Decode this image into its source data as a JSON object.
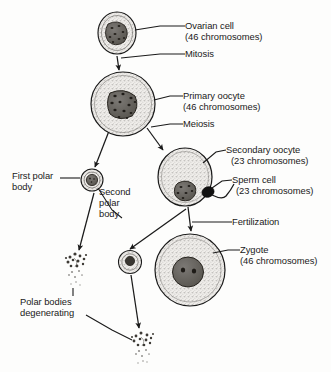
{
  "diagram": {
    "background_color": "#fdfdfc",
    "ink_color": "#1a1a1a",
    "cell_fill": "#e8e6e2",
    "nucleus_fill": "#6d6a66"
  },
  "labels": {
    "ovarian_cell": "Ovarian cell",
    "ovarian_cell_chromosomes": "(46 chromosomes)",
    "mitosis": "Mitosis",
    "primary_oocyte": "Primary oocyte",
    "primary_oocyte_chromosomes": "(46 chromosomes)",
    "meiosis": "Meiosis",
    "secondary_oocyte": "Secondary oocyte",
    "secondary_oocyte_chromosomes": "(23 chromosomes)",
    "sperm_cell": "Sperm cell",
    "sperm_cell_chromosomes": "(23 chromosomes)",
    "fertilization": "Fertilization",
    "zygote": "Zygote",
    "zygote_chromosomes": "(46 chromosomes)",
    "first_polar_body": "First polar\nbody",
    "second_polar_body": "Second\npolar\nbody",
    "polar_bodies_degenerating": "Polar bodies\ndegenerating"
  },
  "cells": [
    {
      "name": "ovarian-cell",
      "cx": 117,
      "cy": 33,
      "rx": 19,
      "ry": 21,
      "nucleus_rx": 11,
      "nucleus_ry": 13,
      "chromosome_count": 46
    },
    {
      "name": "primary-oocyte",
      "cx": 123,
      "cy": 104,
      "rx": 32,
      "ry": 32,
      "nucleus_rx": 14,
      "nucleus_ry": 14,
      "chromosome_count": 46
    },
    {
      "name": "secondary-oocyte",
      "cx": 185,
      "cy": 177,
      "rx": 27,
      "ry": 29,
      "nucleus_rx": 11,
      "nucleus_ry": 11,
      "chromosome_count": 23
    },
    {
      "name": "zygote",
      "cx": 190,
      "cy": 270,
      "rx": 35,
      "ry": 36,
      "nucleus_rx": 15,
      "nucleus_ry": 15,
      "chromosome_count": 46
    },
    {
      "name": "first-polar-body",
      "cx": 92,
      "cy": 180,
      "rx": 11,
      "ry": 11,
      "nucleus_rx": 6,
      "nucleus_ry": 6
    },
    {
      "name": "second-polar-body",
      "cx": 130,
      "cy": 262,
      "rx": 11,
      "ry": 11,
      "nucleus_rx": 5,
      "nucleus_ry": 5
    },
    {
      "name": "sperm-cell",
      "cx": 208,
      "cy": 192,
      "rx": 6,
      "ry": 5
    },
    {
      "name": "degenerating-polar-body-upper",
      "cx": 75,
      "cy": 262
    },
    {
      "name": "degenerating-polar-body-lower",
      "cx": 142,
      "cy": 340
    }
  ],
  "arrows": [
    {
      "name": "mitosis-arrow",
      "from": "ovarian-cell",
      "to": "primary-oocyte"
    },
    {
      "name": "meiosis-arrow-to-first-polar-body",
      "from": "primary-oocyte",
      "to": "first-polar-body"
    },
    {
      "name": "meiosis-arrow-to-secondary-oocyte",
      "from": "primary-oocyte",
      "to": "secondary-oocyte"
    },
    {
      "name": "arrow-to-second-polar-body",
      "from": "secondary-oocyte",
      "to": "second-polar-body"
    },
    {
      "name": "fertilization-arrow-to-zygote",
      "from": "secondary-oocyte",
      "to": "zygote"
    },
    {
      "name": "first-polar-body-degeneration-arrow",
      "from": "first-polar-body",
      "to": "degenerating-polar-body-upper"
    },
    {
      "name": "second-polar-body-degeneration-arrow",
      "from": "second-polar-body",
      "to": "degenerating-polar-body-lower"
    }
  ],
  "leader_lines": [
    {
      "name": "leader-ovarian-cell",
      "label": "ovarian_cell"
    },
    {
      "name": "leader-mitosis",
      "label": "mitosis"
    },
    {
      "name": "leader-primary-oocyte",
      "label": "primary_oocyte"
    },
    {
      "name": "leader-meiosis",
      "label": "meiosis"
    },
    {
      "name": "leader-secondary-oocyte",
      "label": "secondary_oocyte"
    },
    {
      "name": "leader-sperm-cell",
      "label": "sperm_cell"
    },
    {
      "name": "leader-fertilization",
      "label": "fertilization"
    },
    {
      "name": "leader-zygote",
      "label": "zygote"
    },
    {
      "name": "leader-first-polar-body",
      "label": "first_polar_body"
    },
    {
      "name": "leader-second-polar-body",
      "label": "second_polar_body"
    },
    {
      "name": "leader-polar-bodies-degenerating",
      "label": "polar_bodies_degenerating"
    }
  ]
}
